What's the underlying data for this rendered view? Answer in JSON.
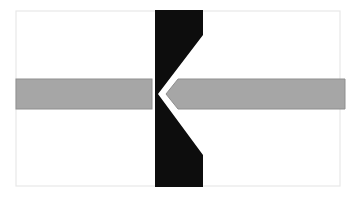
{
  "figure": {
    "title": "Abstract geometric figure: gray horizontal bar with left-pointing arrow intersecting a black K-shaped wedge",
    "canvas": {
      "width": 357,
      "height": 198,
      "background_color": "#ffffff"
    },
    "frame": {
      "name": "outer-frame",
      "x": 16,
      "y": 11,
      "width": 324,
      "height": 175,
      "stroke_color": "#e8e8e8",
      "stroke_width": 1.2,
      "fill_color": "#ffffff"
    },
    "shapes": [
      {
        "id": "gray-bar-left",
        "label": "Left gray bar segment",
        "type": "rectangle",
        "fill_color": "#a6a6a6",
        "stroke_color": "#8f8f8f",
        "stroke_width": 1,
        "x": 16,
        "y": 79,
        "width": 136,
        "height": 30
      },
      {
        "id": "gray-arrow-right",
        "label": "Right gray arrow segment pointing left",
        "type": "polygon",
        "fill_color": "#a6a6a6",
        "stroke_color": "#8f8f8f",
        "stroke_width": 1,
        "points": "166,94 178,79 345,79 345,109 178,109"
      },
      {
        "id": "black-k-wedge",
        "label": "Black K shaped vertical wedge with V notch",
        "type": "polygon",
        "fill_color": "#0d0d0d",
        "stroke_color": "none",
        "points": "155,10 203,10 203,35 158,94 203,155 203,187 155,187"
      }
    ],
    "colors": {
      "background": "#ffffff",
      "gray_fill": "#a6a6a6",
      "gray_edge": "#8f8f8f",
      "black_fill": "#0d0d0d",
      "frame_stroke": "#e8e8e8"
    }
  }
}
